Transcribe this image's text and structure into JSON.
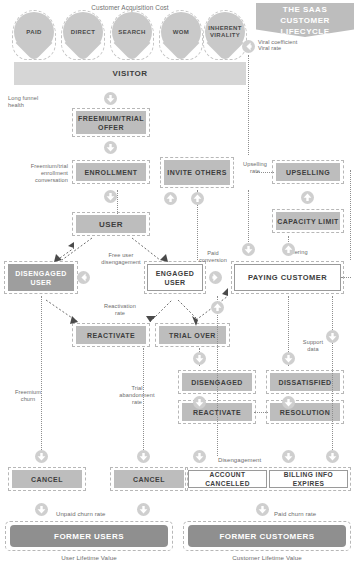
{
  "title": {
    "line1": "THE SAAS",
    "line2": "CUSTOMER LIFECYCLE"
  },
  "headings": {
    "acquisition_cost": "Customer Acquisition Cost"
  },
  "channels": [
    {
      "label": "PAID"
    },
    {
      "label": "DIRECT"
    },
    {
      "label": "SEARCH"
    },
    {
      "label": "WOM"
    },
    {
      "label": "INHERENT VIRALITY"
    }
  ],
  "stages": {
    "visitor": "VISITOR",
    "freemium_trial_offer": "FREEMIUM/TRIAL OFFER",
    "enrollment": "ENROLLMENT",
    "user": "USER",
    "disengaged_user": "DISENGAGED USER",
    "engaged_user": "ENGAGED USER",
    "paying_customer": "PAYING CUSTOMER",
    "invite_others": "INVITE OTHERS",
    "upselling": "UPSELLING",
    "capacity_limit": "CAPACITY LIMIT",
    "reactivate_left": "REACTIVATE",
    "trial_over": "TRIAL OVER",
    "disengaged": "DISENGAGED",
    "dissatisfied": "DISSATISFIED",
    "reactivate_bottom": "REACTIVATE",
    "resolution": "RESOLUTION",
    "cancel_left": "CANCEL",
    "cancel_mid": "CANCEL",
    "account_cancelled": "ACCOUNT CANCELLED",
    "billing_info_expires": "BILLING INFO EXPIRES",
    "former_users": "FORMER USERS",
    "former_customers": "FORMER CUSTOMERS"
  },
  "metrics": {
    "viral_coefficient": "Viral coefficient",
    "viral_rate": "Viral rate",
    "long_funnel_health": "Long funnel\nhealth",
    "long_funnel_health_l1": "Long funnel",
    "long_funnel_health_l2": "health",
    "freemium_enrollment_l1": "Freemium/trial",
    "freemium_enrollment_l2": "enrollment",
    "freemium_enrollment_l3": "conversation",
    "free_user_diseng_l1": "Free user",
    "free_user_diseng_l2": "disengagement",
    "paid_conversion_l1": "Paid",
    "paid_conversion_l2": "conversion",
    "upselling_rate_l1": "Upselling",
    "upselling_rate_l2": "rate",
    "tiering": "Tiering",
    "reactivation_rate_l1": "Reactivation",
    "reactivation_rate_l2": "rate",
    "freemium_churn_l1": "Freemium",
    "freemium_churn_l2": "churn",
    "trial_abandonment_l1": "Trial",
    "trial_abandonment_l2": "abandonment",
    "trial_abandonment_l3": "rate",
    "support_data_l1": "Support",
    "support_data_l2": "data",
    "disengagement": "Disengagement",
    "unpaid_churn_rate": "Unpaid churn rate",
    "paid_churn_rate": "Paid churn rate",
    "user_lifetime_value": "User Lifetime Value",
    "customer_lifetime_value": "Customer Lifetime Value"
  },
  "colors": {
    "box_fill": "#bdbdbd",
    "box_fill_dark": "#9e9e9e",
    "box_outline_border": "#9a9a9a",
    "frame_dash": "#b7b7b7",
    "badge": "#cfcfcf",
    "text": "#3d3d3d",
    "caption": "#6c6c6c",
    "background": "#ffffff"
  },
  "icons": {
    "arrow_down": "arrow-down-icon",
    "arrow_up": "arrow-up-icon",
    "arrow_left": "arrow-left-icon",
    "arrow_right": "arrow-right-icon"
  }
}
